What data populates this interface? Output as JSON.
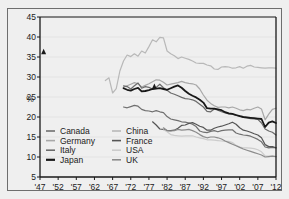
{
  "figure": {
    "background_color": "#efefef",
    "frame_color": "#6e6e6e",
    "axis_color": "#1a1a1a",
    "gridline_color": "#e3e3e3"
  },
  "chart_data": {
    "type": "line",
    "title": "",
    "subtitle": "",
    "xlabel": "",
    "ylabel": "%",
    "xlim": [
      1947,
      2012
    ],
    "ylim": [
      5,
      45
    ],
    "yticks": [
      5,
      10,
      15,
      20,
      25,
      30,
      35,
      40,
      45
    ],
    "ytick_labels": [
      "5",
      "10",
      "15",
      "20",
      "25",
      "30",
      "35",
      "40",
      "45"
    ],
    "xticks": [
      1947,
      1952,
      1957,
      1962,
      1967,
      1972,
      1977,
      1982,
      1987,
      1992,
      1997,
      2002,
      2007,
      2012
    ],
    "xtick_labels": [
      "'47",
      "'52",
      "'57",
      "'62",
      "'67",
      "'72",
      "'77",
      "'82",
      "'87",
      "'92",
      "'97",
      "'02",
      "'07",
      "'12"
    ],
    "grid": true,
    "grid_axis": "y",
    "legend_position": "lower-left-inside",
    "legend_columns": 2,
    "annotations": [
      {
        "name": "marker-canada-1948",
        "marker": "triangle",
        "x": 1948,
        "y": 35.7,
        "color": "#1a1a1a"
      },
      {
        "name": "marker-japan-1978",
        "marker": "triangle",
        "x": 1978.5,
        "y": 27.0,
        "color": "#1a1a1a"
      }
    ],
    "series": [
      {
        "name": "Canada",
        "color": "#707070",
        "width": 1.2,
        "x": [
          1970,
          1971,
          1972,
          1973,
          1974,
          1975,
          1976,
          1977,
          1978,
          1979,
          1980,
          1981,
          1982,
          1983,
          1984,
          1985,
          1986,
          1987,
          1988,
          1989,
          1990,
          1991,
          1992,
          1993,
          1994,
          1995,
          1996,
          1997,
          1998,
          1999,
          2000,
          2001,
          2002,
          2003,
          2004,
          2005,
          2006,
          2007,
          2008,
          2009,
          2010,
          2011,
          2012
        ],
        "values": [
          22.5,
          22.3,
          22.6,
          22.9,
          22.7,
          21.9,
          21.6,
          21.5,
          21.3,
          21.6,
          21.3,
          21.1,
          20.1,
          19.5,
          19.3,
          19.1,
          18.8,
          18.7,
          18.5,
          18.2,
          17.6,
          16.5,
          16.2,
          16.1,
          16.4,
          16.6,
          16.3,
          16.6,
          16.7,
          16.8,
          16.8,
          16.0,
          15.7,
          15.5,
          15.4,
          15.2,
          14.8,
          14.4,
          13.8,
          12.5,
          12.3,
          12.4,
          12.3
        ]
      },
      {
        "name": "Germany",
        "color": "#a8a8a8",
        "width": 1.2,
        "x": [
          1970,
          1971,
          1972,
          1973,
          1974,
          1975,
          1976,
          1977,
          1978,
          1979,
          1980,
          1981,
          1982,
          1983,
          1984,
          1985,
          1986,
          1987,
          1988,
          1989,
          1990,
          1991,
          1992,
          1993,
          1994,
          1995,
          1996,
          1997,
          1998,
          1999,
          2000,
          2001,
          2002,
          2003,
          2004,
          2005,
          2006,
          2007,
          2008,
          2009,
          2010,
          2011,
          2012
        ],
        "values": [
          27.4,
          27.8,
          28.2,
          28.6,
          28.3,
          27.5,
          27.9,
          28.3,
          28.8,
          29.3,
          29.2,
          28.7,
          28.0,
          28.2,
          28.4,
          28.6,
          28.9,
          28.6,
          28.4,
          28.3,
          28.0,
          27.0,
          25.5,
          24.2,
          23.4,
          22.8,
          22.4,
          22.5,
          22.5,
          22.3,
          22.5,
          22.2,
          21.8,
          21.6,
          21.9,
          21.8,
          22.2,
          22.5,
          22.0,
          19.3,
          20.7,
          21.9,
          22.2
        ]
      },
      {
        "name": "Italy",
        "color": "#6b6b6b",
        "width": 1.2,
        "x": [
          1970,
          1971,
          1972,
          1973,
          1974,
          1975,
          1976,
          1977,
          1978,
          1979,
          1980,
          1981,
          1982,
          1983,
          1984,
          1985,
          1986,
          1987,
          1988,
          1989,
          1990,
          1991,
          1992,
          1993,
          1994,
          1995,
          1996,
          1997,
          1998,
          1999,
          2000,
          2001,
          2002,
          2003,
          2004,
          2005,
          2006,
          2007,
          2008,
          2009,
          2010,
          2011,
          2012
        ],
        "values": [
          27.8,
          27.6,
          27.0,
          27.8,
          28.5,
          27.2,
          27.6,
          27.4,
          27.0,
          27.4,
          28.2,
          27.3,
          26.7,
          26.0,
          25.7,
          25.3,
          24.9,
          24.6,
          24.5,
          24.3,
          23.9,
          23.2,
          22.5,
          21.4,
          21.3,
          22.0,
          21.7,
          21.3,
          21.0,
          20.8,
          20.7,
          20.4,
          20.3,
          19.9,
          19.8,
          19.6,
          19.5,
          19.4,
          18.5,
          17.0,
          16.5,
          16.2,
          15.5
        ]
      },
      {
        "name": "Japan",
        "color": "#181818",
        "width": 1.8,
        "x": [
          1970,
          1971,
          1972,
          1973,
          1974,
          1975,
          1976,
          1977,
          1978,
          1979,
          1980,
          1981,
          1982,
          1983,
          1984,
          1985,
          1986,
          1987,
          1988,
          1989,
          1990,
          1991,
          1992,
          1993,
          1994,
          1995,
          1996,
          1997,
          1998,
          1999,
          2000,
          2001,
          2002,
          2003,
          2004,
          2005,
          2006,
          2007,
          2008,
          2009,
          2010,
          2011,
          2012
        ],
        "values": [
          27.2,
          26.8,
          26.6,
          27.0,
          27.3,
          26.4,
          26.5,
          26.7,
          27.0,
          27.1,
          27.2,
          27.0,
          26.8,
          27.2,
          27.6,
          27.9,
          27.3,
          26.5,
          25.8,
          25.3,
          24.9,
          24.3,
          23.6,
          22.2,
          22.1,
          22.1,
          21.9,
          21.7,
          21.2,
          20.9,
          20.8,
          20.5,
          20.2,
          20.0,
          19.9,
          19.8,
          19.7,
          19.6,
          19.5,
          17.5,
          18.6,
          18.9,
          18.5
        ]
      },
      {
        "name": "China",
        "color": "#b8b8b8",
        "width": 1.2,
        "x": [
          1965,
          1966,
          1967,
          1968,
          1969,
          1970,
          1971,
          1972,
          1973,
          1974,
          1975,
          1976,
          1977,
          1978,
          1979,
          1980,
          1981,
          1982,
          1983,
          1984,
          1985,
          1986,
          1987,
          1988,
          1989,
          1990,
          1991,
          1992,
          1993,
          1994,
          1995,
          1996,
          1997,
          1998,
          1999,
          2000,
          2001,
          2002,
          2003,
          2004,
          2005,
          2006,
          2007,
          2008,
          2009,
          2010,
          2011,
          2012
        ],
        "values": [
          29.1,
          29.8,
          26.0,
          27.1,
          31.5,
          34.0,
          35.5,
          35.1,
          35.8,
          35.2,
          36.5,
          36.0,
          37.6,
          39.3,
          38.8,
          39.9,
          39.8,
          36.5,
          35.8,
          35.3,
          34.6,
          35.0,
          34.7,
          34.4,
          34.0,
          33.5,
          33.4,
          33.4,
          33.0,
          32.8,
          32.0,
          31.9,
          32.5,
          32.6,
          32.5,
          32.2,
          32.3,
          32.6,
          32.2,
          32.7,
          32.9,
          32.5,
          32.4,
          32.3,
          32.2,
          32.3,
          32.3,
          32.2
        ]
      },
      {
        "name": "France",
        "color": "#555555",
        "width": 1.2,
        "x": [
          1978,
          1979,
          1980,
          1981,
          1982,
          1983,
          1984,
          1985,
          1986,
          1987,
          1988,
          1989,
          1990,
          1991,
          1992,
          1993,
          1994,
          1995,
          1996,
          1997,
          1998,
          1999,
          2000,
          2001,
          2002,
          2003,
          2004,
          2005,
          2006,
          2007,
          2008,
          2009,
          2010,
          2011,
          2012
        ],
        "values": [
          18.8,
          18.0,
          17.0,
          16.9,
          16.6,
          16.6,
          16.7,
          17.2,
          17.9,
          18.0,
          18.4,
          18.6,
          18.2,
          17.7,
          17.4,
          16.7,
          16.7,
          17.2,
          17.5,
          17.7,
          18.0,
          18.3,
          18.7,
          18.2,
          17.3,
          16.7,
          16.5,
          16.2,
          15.8,
          15.5,
          14.8,
          13.1,
          12.6,
          12.6,
          12.3
        ]
      },
      {
        "name": "USA",
        "color": "#cccccc",
        "width": 1.2,
        "x": [
          1981,
          1982,
          1983,
          1984,
          1985,
          1986,
          1987,
          1988,
          1989,
          1990,
          1991,
          1992,
          1993,
          1994,
          1995,
          1996,
          1997,
          1998,
          1999,
          2000,
          2001,
          2002,
          2003,
          2004,
          2005,
          2006,
          2007,
          2008,
          2009,
          2010,
          2011,
          2012
        ],
        "values": [
          16.8,
          16.3,
          15.6,
          15.4,
          15.3,
          15.2,
          15.3,
          15.3,
          15.3,
          15.0,
          14.8,
          14.6,
          14.3,
          14.3,
          14.2,
          14.1,
          14.0,
          13.9,
          13.9,
          13.6,
          12.9,
          12.5,
          12.3,
          12.3,
          12.2,
          12.1,
          11.8,
          11.3,
          10.3,
          10.2,
          10.2,
          10.1
        ]
      },
      {
        "name": "UK",
        "color": "#8c8c8c",
        "width": 1.2,
        "x": [
          1981,
          1982,
          1983,
          1984,
          1985,
          1986,
          1987,
          1988,
          1989,
          1990,
          1991,
          1992,
          1993,
          1994,
          1995,
          1996,
          1997,
          1998,
          1999,
          2000,
          2001,
          2002,
          2003,
          2004,
          2005,
          2006,
          2007,
          2008,
          2009,
          2010,
          2011,
          2012
        ],
        "values": [
          17.3,
          16.6,
          16.5,
          16.6,
          16.9,
          16.7,
          16.8,
          16.9,
          16.6,
          16.2,
          15.6,
          15.1,
          14.8,
          15.0,
          15.0,
          14.8,
          14.5,
          14.0,
          13.6,
          13.2,
          12.8,
          12.4,
          12.0,
          11.7,
          11.4,
          11.1,
          10.8,
          10.5,
          10.0,
          10.1,
          10.2,
          10.1
        ]
      }
    ]
  },
  "legend": {
    "column_left": [
      {
        "label": "Canada",
        "color": "#707070",
        "width": 1.2
      },
      {
        "label": "Germany",
        "color": "#a8a8a8",
        "width": 1.2
      },
      {
        "label": "Italy",
        "color": "#6b6b6b",
        "width": 1.2
      },
      {
        "label": "Japan",
        "color": "#181818",
        "width": 1.8
      }
    ],
    "column_right": [
      {
        "label": "China",
        "color": "#b8b8b8",
        "width": 1.2
      },
      {
        "label": "France",
        "color": "#555555",
        "width": 1.2
      },
      {
        "label": "USA",
        "color": "#cccccc",
        "width": 1.2
      },
      {
        "label": "UK",
        "color": "#8c8c8c",
        "width": 1.2
      }
    ]
  }
}
